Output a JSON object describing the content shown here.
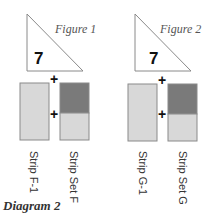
{
  "title": "Diagram 2",
  "colors": {
    "outline": "#8a8a8a",
    "light_fill": "#d8d8d8",
    "dark_fill": "#7a7a7a"
  },
  "figures": [
    {
      "label": "Figure 1",
      "triangle_number": "7",
      "plus_top": "+",
      "plus_middle": "+",
      "strips": [
        {
          "label": "Strip F-1"
        },
        {
          "label": "Strip Set F"
        }
      ]
    },
    {
      "label": "Figure 2",
      "triangle_number": "7",
      "plus_top": "+",
      "plus_middle": "+",
      "strips": [
        {
          "label": "Strip G-1"
        },
        {
          "label": "Strip Set G"
        }
      ]
    }
  ]
}
